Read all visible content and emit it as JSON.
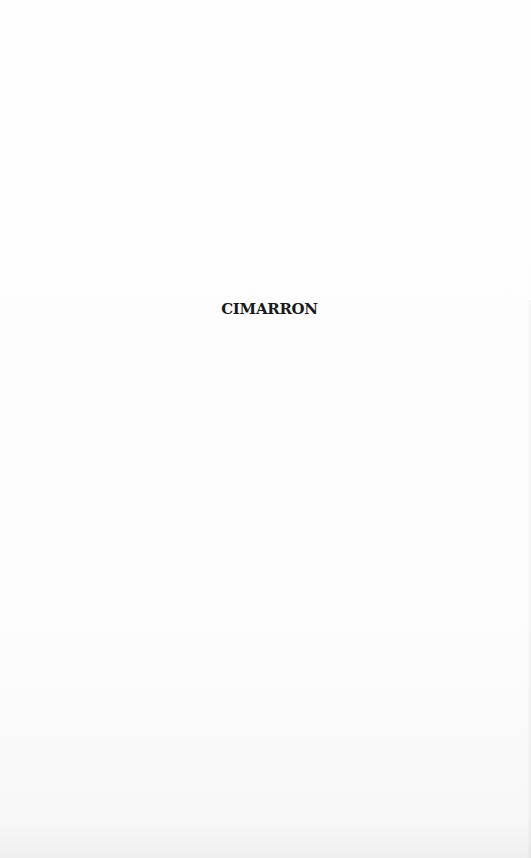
{
  "page": {
    "title": "CIMARRON"
  }
}
